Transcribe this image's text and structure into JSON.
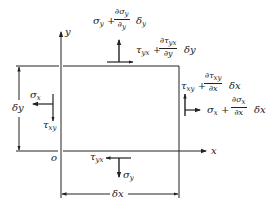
{
  "diagram": {
    "axes": {
      "x_label": "x",
      "y_label": "y",
      "origin_label": "o"
    },
    "dimensions": {
      "width_label": "δx",
      "height_label": "δy"
    },
    "stresses": {
      "top": {
        "normal": {
          "base": "σ",
          "sub": "y",
          "plus": "+",
          "num": "∂σ",
          "num_sub": "y",
          "den": "∂",
          "den_sub": "y",
          "tail": "δ",
          "tail_sub": "y"
        },
        "shear": {
          "base": "τ",
          "sub": "yx",
          "plus": "+",
          "num": "∂τ",
          "num_sub": "yx",
          "den": "∂y",
          "tail": "δy"
        }
      },
      "right": {
        "shear": {
          "base": "τ",
          "sub": "xy",
          "plus": "+",
          "num": "∂τ",
          "num_sub": "xy",
          "den": "∂x",
          "tail": "δx"
        },
        "normal": {
          "base": "σ",
          "sub": "x",
          "plus": "+",
          "num": "∂σ",
          "num_sub": "x",
          "den": "∂x",
          "tail": "δx"
        }
      },
      "left": {
        "normal": {
          "base": "σ",
          "sub": "x"
        },
        "shear": {
          "base": "τ",
          "sub": "xy"
        }
      },
      "bottom": {
        "shear": {
          "base": "τ",
          "sub": "yx"
        },
        "normal": {
          "base": "σ",
          "sub": "y"
        }
      }
    },
    "colors": {
      "ink": "#222222",
      "background": "#ffffff"
    }
  }
}
